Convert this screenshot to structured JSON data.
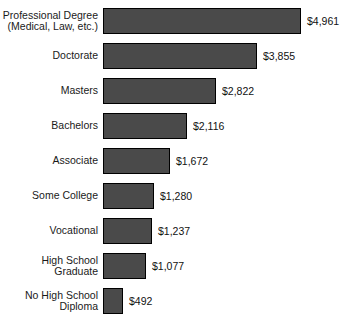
{
  "chart_data": {
    "type": "bar",
    "orientation": "horizontal",
    "title": "",
    "subtitle": "",
    "xlabel": "",
    "ylabel": "",
    "grid": false,
    "legend": null,
    "axis_line": false,
    "xlim": [
      0,
      4961
    ],
    "bar_color": "#4a4a4a",
    "bar_border_color": "#000000",
    "background_color": "#ffffff",
    "categories": [
      "Professional Degree\n(Medical, Law, etc.)",
      "Doctorate",
      "Masters",
      "Bachelors",
      "Associate",
      "Some College",
      "Vocational",
      "High School\nGraduate",
      "No High School\nDiploma"
    ],
    "values": [
      4961,
      3855,
      2822,
      2116,
      1672,
      1280,
      1237,
      1077,
      492
    ],
    "value_labels": [
      "$4,961",
      "$3,855",
      "$2,822",
      "$2,116",
      "$1,672",
      "$1,280",
      "$1,237",
      "$1,077",
      "$492"
    ],
    "bars": [
      {
        "category": "Professional Degree\n(Medical, Law, etc.)",
        "value": 4961,
        "label": "$4,961"
      },
      {
        "category": "Doctorate",
        "value": 3855,
        "label": "$3,855"
      },
      {
        "category": "Masters",
        "value": 2822,
        "label": "$2,822"
      },
      {
        "category": "Bachelors",
        "value": 2116,
        "label": "$2,116"
      },
      {
        "category": "Associate",
        "value": 1672,
        "label": "$1,672"
      },
      {
        "category": "Some College",
        "value": 1280,
        "label": "$1,280"
      },
      {
        "category": "Vocational",
        "value": 1237,
        "label": "$1,237"
      },
      {
        "category": "High School\nGraduate",
        "value": 1077,
        "label": "$1,077"
      },
      {
        "category": "No High School\nDiploma",
        "value": 492,
        "label": "$492"
      }
    ]
  }
}
